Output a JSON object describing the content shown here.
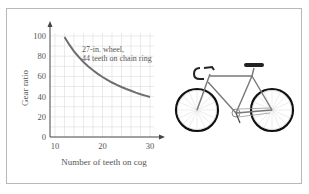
{
  "chart_data": {
    "type": "line",
    "title": "",
    "xlabel": "Number of teeth on cog",
    "ylabel": "Gear ratio",
    "xlim": [
      10,
      30
    ],
    "ylim": [
      0,
      100
    ],
    "x_ticks": [
      "10",
      "20",
      "30"
    ],
    "y_ticks": [
      "0",
      "20",
      "40",
      "60",
      "80",
      "100"
    ],
    "grid": true,
    "annotation": [
      "27-in. wheel,",
      "44 teeth on chain ring"
    ],
    "series": [
      {
        "name": "Gear ratio (27 × 44 / teeth)",
        "x": [
          12,
          13,
          14,
          15,
          16,
          17,
          18,
          19,
          20,
          21,
          22,
          23,
          24,
          25,
          26,
          27,
          28,
          29,
          30
        ],
        "y": [
          99.0,
          91.4,
          84.9,
          79.2,
          74.3,
          69.9,
          66.0,
          62.5,
          59.4,
          56.6,
          54.0,
          51.7,
          49.5,
          47.5,
          45.7,
          44.0,
          42.4,
          41.0,
          39.6
        ]
      }
    ],
    "colors": {
      "curve": "#6e6e6e",
      "grid": "#dcdcdc",
      "axis": "#444444"
    }
  },
  "illustration": {
    "label": "bicycle"
  }
}
